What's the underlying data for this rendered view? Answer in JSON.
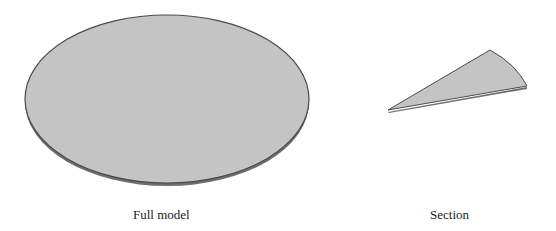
{
  "figure": {
    "panels": [
      {
        "id": "full",
        "caption": "Full model",
        "shape": "disk"
      },
      {
        "id": "section",
        "caption": "Section",
        "shape": "wedge-sector"
      }
    ],
    "colors": {
      "face": "#c4c4c4",
      "edge": "#555555",
      "thickness": "#777777",
      "background": "#ffffff"
    }
  }
}
